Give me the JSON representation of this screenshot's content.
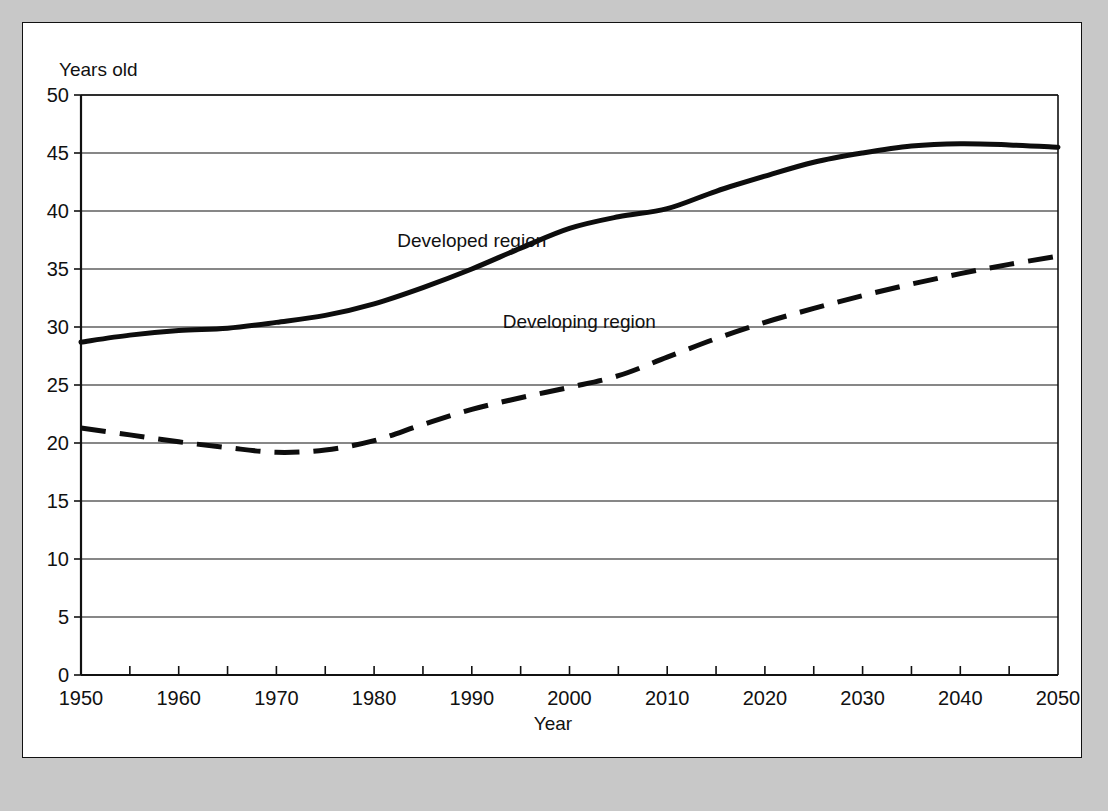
{
  "chart_data": {
    "type": "line",
    "title": "",
    "subtitle": "",
    "xlabel": "Year",
    "ylabel": "Years old",
    "ylim": [
      0,
      50
    ],
    "xlim": [
      1950,
      2050
    ],
    "grid": "horizontal",
    "legend_position": "inline-annotations",
    "y_ticks": [
      0,
      5,
      10,
      15,
      20,
      25,
      30,
      35,
      40,
      45,
      50
    ],
    "y_tick_labels": [
      "0",
      "5",
      "10",
      "15",
      "20",
      "25",
      "30",
      "35",
      "40",
      "45",
      "50"
    ],
    "x_ticks": [
      1950,
      1960,
      1970,
      1980,
      1990,
      2000,
      2010,
      2020,
      2030,
      2040,
      2050
    ],
    "x_tick_labels": [
      "1950",
      "1960",
      "1970",
      "1980",
      "1990",
      "2000",
      "2010",
      "2020",
      "2030",
      "2040",
      "2050"
    ],
    "x_minor_ticks": [
      1955,
      1965,
      1975,
      1985,
      1995,
      2005,
      2015,
      2025,
      2035,
      2045
    ],
    "x": [
      1950,
      1955,
      1960,
      1965,
      1970,
      1975,
      1980,
      1985,
      1990,
      1995,
      2000,
      2005,
      2010,
      2015,
      2020,
      2025,
      2030,
      2035,
      2040,
      2045,
      2050
    ],
    "series": [
      {
        "name": "Developed region",
        "style": "solid",
        "color": "#0d0d0d",
        "width": 5,
        "annotation": "Developed region",
        "annotation_x": 1990,
        "annotation_y": 37.4,
        "values": [
          28.7,
          29.3,
          29.7,
          29.9,
          30.4,
          31.0,
          32.0,
          33.4,
          35.0,
          36.8,
          38.5,
          39.5,
          40.2,
          41.7,
          43.0,
          44.2,
          45.0,
          45.6,
          45.8,
          45.7,
          45.5
        ]
      },
      {
        "name": "Developing region",
        "style": "dashed",
        "color": "#0d0d0d",
        "width": 5,
        "annotation": "Developing region",
        "annotation_x": 2001,
        "annotation_y": 30.4,
        "values": [
          21.3,
          20.7,
          20.1,
          19.6,
          19.2,
          19.4,
          20.2,
          21.6,
          22.9,
          23.9,
          24.8,
          25.8,
          27.4,
          29.0,
          30.4,
          31.6,
          32.7,
          33.7,
          34.6,
          35.4,
          36.1
        ]
      }
    ]
  }
}
